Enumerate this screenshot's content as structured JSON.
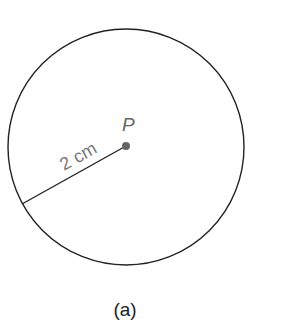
{
  "diagram": {
    "circle": {
      "cx": 126,
      "cy": 147,
      "r": 118,
      "stroke": "#222222"
    },
    "center_point": {
      "label": "P",
      "x": 126,
      "y": 146,
      "color": "#666666"
    },
    "radius": {
      "label": "2 cm",
      "x1": 22,
      "y1": 204,
      "x2": 126,
      "y2": 146
    },
    "caption": "(a)"
  }
}
